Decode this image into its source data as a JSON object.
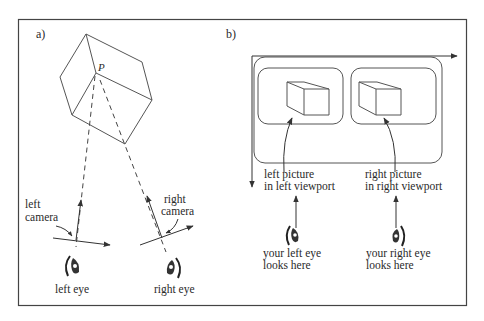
{
  "figure": {
    "panel_a": {
      "label": "a)",
      "point_label": "P",
      "left_camera_label": [
        "left",
        "camera"
      ],
      "right_camera_label": [
        "right",
        "camera"
      ],
      "left_eye_label": "left eye",
      "right_eye_label": "right eye"
    },
    "panel_b": {
      "label": "b)",
      "left_picture_label": [
        "left picture",
        "in left viewport"
      ],
      "right_picture_label": [
        "right picture",
        "in right viewport"
      ],
      "left_eye_caption": [
        "your left eye",
        "looks here"
      ],
      "right_eye_caption": [
        "your right eye",
        "looks here"
      ]
    },
    "colors": {
      "line": "#444444",
      "background": "#ffffff"
    }
  }
}
